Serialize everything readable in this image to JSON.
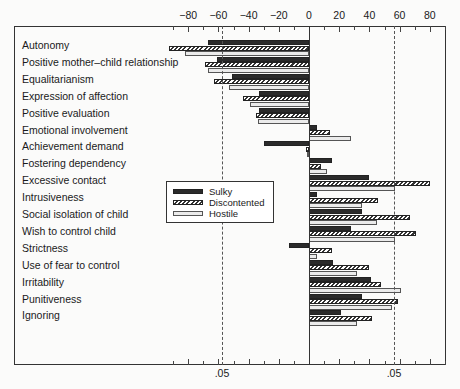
{
  "chart_data": {
    "type": "bar",
    "orientation": "horizontal",
    "title": "",
    "xlabel": "",
    "ylabel": "",
    "xlim": [
      -95,
      90
    ],
    "x_ticks": [
      -80,
      -60,
      -40,
      -20,
      0,
      20,
      40,
      60,
      80
    ],
    "x_tick_labels": [
      "−80",
      "−60",
      "−40",
      "−20",
      "0",
      "20",
      "40",
      "60",
      "80"
    ],
    "significance_lines": [
      {
        "value": -56,
        "label": ".05"
      },
      {
        "value": 56,
        "label": ".05"
      }
    ],
    "grid": false,
    "legend_position": "inside-left-middle",
    "categories": [
      "Autonomy",
      "Positive mother–child relationship",
      "Equalitarianism",
      "Expression of affection",
      "Positive evaluation",
      "Emotional involvement",
      "Achievement demand",
      "Fostering dependency",
      "Excessive contact",
      "Intrusiveness",
      "Social isolation of child",
      "Wish to control child",
      "Strictness",
      "Use of fear to control",
      "Irritability",
      "Punitiveness",
      "Ignoring"
    ],
    "series": [
      {
        "name": "Sulky",
        "style": "solid-dark",
        "values": [
          -67,
          -61,
          -51,
          -33,
          -33,
          5,
          -30,
          15,
          40,
          5,
          35,
          28,
          -13,
          16,
          41,
          35,
          21
        ]
      },
      {
        "name": "Discontented",
        "style": "hatched",
        "values": [
          -93,
          -69,
          -63,
          -44,
          -35,
          14,
          -2,
          8,
          80,
          46,
          67,
          71,
          15,
          40,
          48,
          59,
          42
        ]
      },
      {
        "name": "Hostile",
        "style": "light",
        "values": [
          -82,
          -67,
          -53,
          -39,
          -34,
          28,
          -1,
          12,
          57,
          35,
          45,
          57,
          5,
          32,
          61,
          55,
          32
        ]
      }
    ]
  },
  "legend": {
    "items": [
      {
        "label": "Sulky"
      },
      {
        "label": "Discontented"
      },
      {
        "label": "Hostile"
      }
    ]
  },
  "axis": {
    "significance_label": ".05"
  }
}
